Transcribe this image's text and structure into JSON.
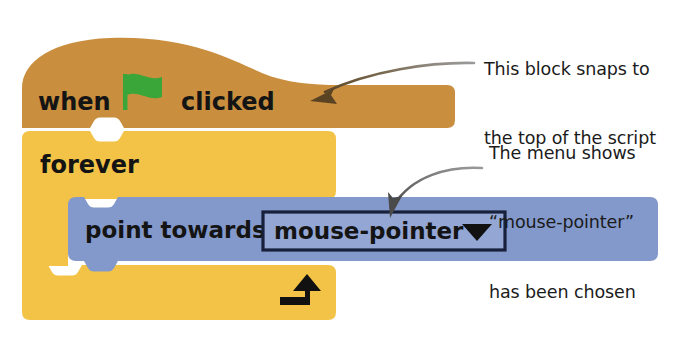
{
  "figure": {
    "kind": "scratch-block-script-diagram",
    "background_color": "#ffffff"
  },
  "palette": {
    "events_brown": "#C98F3F",
    "control_yellow": "#F2C346",
    "motion_blue": "#8399CB",
    "dropdown_fill": "#8FA3D2",
    "dropdown_border": "#17213B",
    "text_dark": "#141414",
    "flag_green": "#3AA63A",
    "arrow_gray": "#6E6E6E",
    "arrow_brown": "#5E4625"
  },
  "script": {
    "blocks": [
      {
        "id": "when-flag-clicked",
        "type": "hat",
        "category": "events",
        "color": "#C98F3F",
        "label_before": "when",
        "icon": "green-flag-icon",
        "label_after": "clicked"
      },
      {
        "id": "forever",
        "type": "c-block",
        "category": "control",
        "color": "#F2C346",
        "label": "forever",
        "loop_icon": "loop-arrow-icon"
      },
      {
        "id": "point-towards",
        "type": "stack",
        "category": "motion",
        "color": "#8399CB",
        "label": "point towards",
        "dropdown": {
          "name": "point-towards-dropdown",
          "value": "mouse-pointer",
          "arrow_icon": "chevron-down-icon"
        }
      }
    ]
  },
  "annotations": [
    {
      "id": "annotation-hat-block",
      "lines": [
        "This block snaps to",
        "the top of the script"
      ],
      "arrow": "curved-arrow-to-hat-block"
    },
    {
      "id": "annotation-dropdown",
      "lines": [
        "The menu shows",
        "“mouse-pointer”",
        "has been chosen"
      ],
      "arrow": "curved-arrow-to-dropdown"
    }
  ]
}
